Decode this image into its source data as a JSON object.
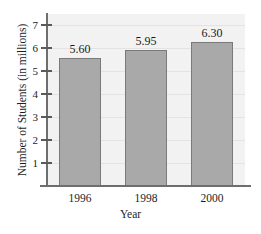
{
  "chart_data": {
    "type": "bar",
    "title": "",
    "subtitle": "",
    "categories": [
      "1996",
      "1998",
      "2000"
    ],
    "values": [
      5.6,
      5.95,
      6.3
    ],
    "data_labels": [
      "5.60",
      "5.95",
      "6.30"
    ],
    "xlabel": "Year",
    "ylabel": "Number of Students (in millions)",
    "ylim": [
      0,
      7.5
    ],
    "yticks": [
      1,
      2,
      3,
      4,
      5,
      6,
      7
    ],
    "ytick_labels": [
      "1",
      "2",
      "3",
      "4",
      "5",
      "6",
      "7"
    ],
    "grid": true,
    "grid_axis": "y",
    "legend": false,
    "legend_position": "none",
    "colors": {
      "bar_fill": "#a9a9a9",
      "bar_edge": "#7a7a7a",
      "plot_background": "#f2f2f2",
      "gridline": "#e3e3e3",
      "axis": "#6e6e6e",
      "text": "#1e1e1e",
      "figure_background": "#ffffff"
    }
  }
}
